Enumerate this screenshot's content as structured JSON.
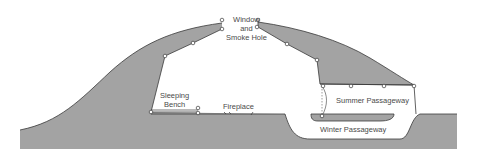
{
  "diagram": {
    "labels": {
      "window_line1": "Window",
      "window_line2": "and",
      "window_line3": "Smoke Hole",
      "sleeping_line1": "Sleeping",
      "sleeping_line2": "Bench",
      "fireplace": "Fireplace",
      "summer": "Summer Passageway",
      "winter": "Winter Passageway"
    },
    "colors": {
      "fill": "#a3a3a3",
      "stroke": "#3a3a3a",
      "background": "#ffffff",
      "text": "#4a4a4a"
    }
  }
}
